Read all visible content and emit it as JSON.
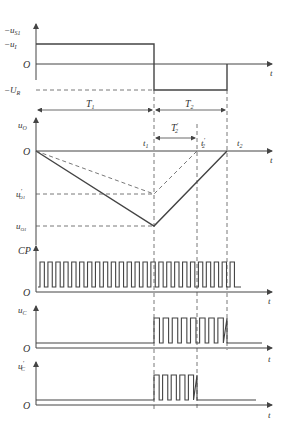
{
  "diagram": {
    "type": "timing-diagram",
    "color_line": "#444444",
    "color_dash": "#555555",
    "panels": [
      {
        "id": "input",
        "y_axis_label": "-u_S1",
        "levels": [
          "-u_I",
          "O",
          "-U_R"
        ],
        "x_axis_label": "t",
        "annotations": [
          "T1",
          "T2"
        ]
      },
      {
        "id": "integrator",
        "y_axis_label": "u_O",
        "levels": [
          "O",
          "u'_O1",
          "u_O1"
        ],
        "x_axis_label": "t",
        "time_markers": [
          "t1",
          "t'2",
          "t2"
        ],
        "annotations": [
          "T'2"
        ]
      },
      {
        "id": "clock",
        "y_axis_label": "CP",
        "origin": "O",
        "x_axis_label": "t",
        "pulse_count": 25
      },
      {
        "id": "counter-output",
        "y_axis_label": "u_C",
        "origin": "O",
        "x_axis_label": "t",
        "pulse_count": 8
      },
      {
        "id": "counter-output-prime",
        "y_axis_label": "u'_C",
        "origin": "O",
        "x_axis_label": "t",
        "pulse_count": 5
      }
    ]
  },
  "labels": {
    "neg_us1": "−u",
    "neg_us1_sub": "S1",
    "neg_ui": "−u",
    "neg_ui_sub": "I",
    "origin": "O",
    "neg_ur": "−U",
    "neg_ur_sub": "R",
    "t": "t",
    "T1": "T",
    "T1_sub": "1",
    "T2": "T",
    "T2_sub": "2",
    "uo": "u",
    "uo_sub": "O",
    "T2p": "T",
    "T2p_sub": "2",
    "T2p_prime": "′",
    "t1": "t",
    "t1_sub": "1",
    "t2p": "t",
    "t2p_sub": "2",
    "t2p_prime": "′",
    "t2": "t",
    "t2_sub": "2",
    "uo1p": "u",
    "uo1p_sub": "O1",
    "uo1p_prime": "′",
    "uo1": "u",
    "uo1_sub": "O1",
    "cp": "CP",
    "uc": "u",
    "uc_sub": "C",
    "ucp": "u",
    "ucp_sub": "C",
    "ucp_prime": "′"
  }
}
